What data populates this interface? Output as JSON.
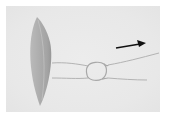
{
  "image": {
    "description": "Grayscale micrograph of an elongated spindle-shaped cell (diatom) on the left with two thin filaments extending right, joined by a small loop/knot, and a black arrow pointing right in the upper right.",
    "colors": {
      "background": "#ffffff",
      "photo_field": "#eaeaea",
      "cell_body": "#a9a9a9",
      "filament": "#b8b8b8",
      "arrow": "#111111"
    },
    "annotations": [
      {
        "type": "arrow",
        "direction": "right"
      }
    ]
  }
}
